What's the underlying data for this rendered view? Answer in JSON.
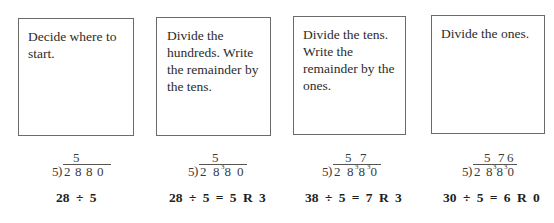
{
  "steps": [
    {
      "instruction": "Decide where to start.",
      "quotient": [
        "5",
        "",
        ""
      ],
      "divisor": "5",
      "dividend": [
        {
          "d": "2",
          "r": ""
        },
        {
          "d": "8",
          "r": ""
        },
        {
          "d": "8",
          "r": ""
        },
        {
          "d": "0",
          "r": ""
        }
      ],
      "equation": "28 ÷ 5"
    },
    {
      "instruction": "Divide the hundreds. Write the remainder by the tens.",
      "quotient": [
        "5",
        "",
        ""
      ],
      "divisor": "5",
      "dividend": [
        {
          "d": "2",
          "r": ""
        },
        {
          "d": "8",
          "r": ""
        },
        {
          "d": "8",
          "r": "3"
        },
        {
          "d": "0",
          "r": ""
        }
      ],
      "equation": "28 ÷ 5 = 5 R 3"
    },
    {
      "instruction": "Divide the tens. Write the remainder by the ones.",
      "quotient": [
        "5",
        "7",
        ""
      ],
      "divisor": "5",
      "dividend": [
        {
          "d": "2",
          "r": ""
        },
        {
          "d": "8",
          "r": ""
        },
        {
          "d": "8",
          "r": "3"
        },
        {
          "d": "0",
          "r": "3"
        }
      ],
      "equation": "38 ÷ 5 = 7 R 3"
    },
    {
      "instruction": "Divide the ones.",
      "quotient": [
        "5",
        "7",
        "6"
      ],
      "divisor": "5",
      "dividend": [
        {
          "d": "2",
          "r": ""
        },
        {
          "d": "8",
          "r": ""
        },
        {
          "d": "8",
          "r": "3"
        },
        {
          "d": "0",
          "r": "3"
        }
      ],
      "equation": "30 ÷ 5 = 6 R 0"
    }
  ],
  "bracket_glyph": ")"
}
